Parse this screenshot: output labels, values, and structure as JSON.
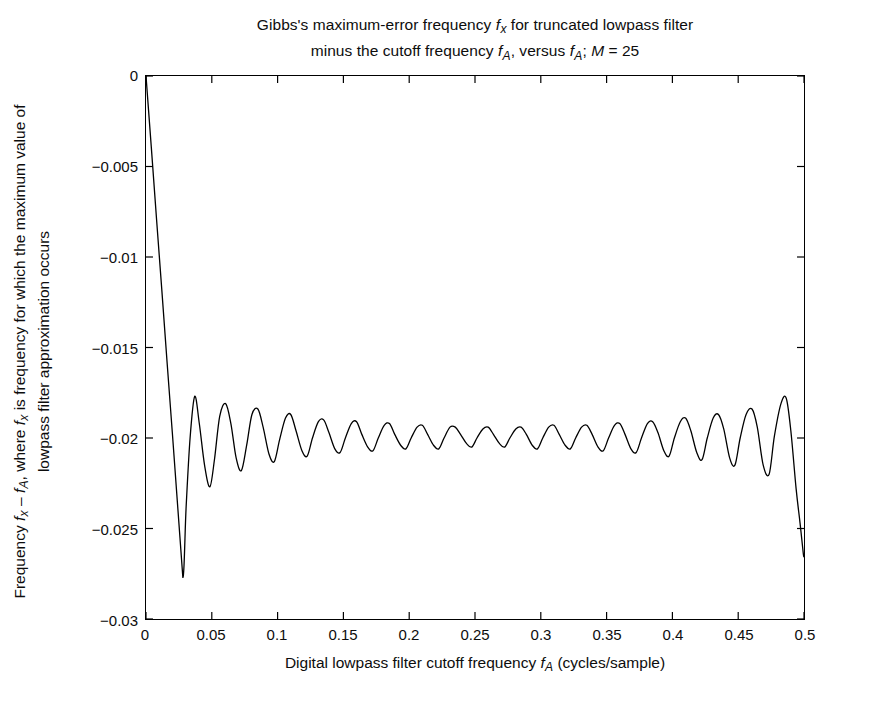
{
  "figure": {
    "background_color": "#ffffff",
    "line_color": "#000000",
    "axis_color": "#000000"
  },
  "title": {
    "line1_pre": "Gibbs's maximum-error frequency ",
    "line1_var": "f",
    "line1_sub": "x",
    "line1_post": " for truncated lowpass filter",
    "line2_pre": "minus the cutoff frequency ",
    "line2_var1": "f",
    "line2_sub1": "A",
    "line2_mid": ", versus ",
    "line2_var2": "f",
    "line2_sub2": "A",
    "line2_post": "; ",
    "line2_m": "M",
    "line2_meq": " = 25",
    "full_text": "Gibbs's maximum-error frequency fx for truncated lowpass filter minus the cutoff frequency fA, versus fA; M = 25"
  },
  "x_axis": {
    "label_pre": "Digital lowpass filter cutoff frequency ",
    "label_var": "f",
    "label_sub": "A",
    "label_post": " (cycles/sample)",
    "label_full": "Digital lowpass filter cutoff frequency fA (cycles/sample)",
    "ticks": [
      "0",
      "0.05",
      "0.1",
      "0.15",
      "0.2",
      "0.25",
      "0.3",
      "0.35",
      "0.4",
      "0.45",
      "0.5"
    ],
    "tick_values": [
      0,
      0.05,
      0.1,
      0.15,
      0.2,
      0.25,
      0.3,
      0.35,
      0.4,
      0.45,
      0.5
    ],
    "min": 0,
    "max": 0.5
  },
  "y_axis": {
    "label_line1_pre": "Frequency ",
    "label_line1_v1": "f",
    "label_line1_s1": "x",
    "label_line1_mid1": " – ",
    "label_line1_v2": "f",
    "label_line1_s2": "A",
    "label_line1_mid2": ", where ",
    "label_line1_v3": "f",
    "label_line1_s3": "x",
    "label_line1_post": " is frequency for which the maximum value of",
    "label_line2": "lowpass filter approximation occurs",
    "label_full": "Frequency fx – fA, where fx is frequency for which the maximum value of lowpass filter approximation occurs",
    "ticks": [
      "0",
      "−0.005",
      "−0.01",
      "−0.015",
      "−0.02",
      "−0.025",
      "−0.03"
    ],
    "tick_values": [
      0,
      -0.005,
      -0.01,
      -0.015,
      -0.02,
      -0.025,
      -0.03
    ],
    "min": -0.03,
    "max": 0
  },
  "chart_data": {
    "type": "line",
    "title": "Gibbs's maximum-error frequency fx for truncated lowpass filter minus the cutoff frequency fA, versus fA; M = 25",
    "xlabel": "Digital lowpass filter cutoff frequency fA (cycles/sample)",
    "ylabel": "Frequency fx – fA, where fx is frequency for which the maximum value of lowpass filter approximation occurs",
    "xlim": [
      0,
      0.5
    ],
    "ylim": [
      -0.03,
      0
    ],
    "grid": false,
    "legend": null,
    "series": [
      {
        "name": "fx - fA",
        "color": "#000000",
        "linewidth": 1.2,
        "x": [
          0.0,
          0.004,
          0.008,
          0.012,
          0.016,
          0.02,
          0.024,
          0.028,
          0.0305,
          0.0335,
          0.037,
          0.0405,
          0.0445,
          0.0485,
          0.052,
          0.056,
          0.0605,
          0.0645,
          0.0685,
          0.0725,
          0.0765,
          0.0805,
          0.085,
          0.089,
          0.0935,
          0.0975,
          0.1015,
          0.106,
          0.11,
          0.114,
          0.1185,
          0.1225,
          0.1265,
          0.131,
          0.135,
          0.139,
          0.1435,
          0.1475,
          0.1515,
          0.156,
          0.16,
          0.164,
          0.1685,
          0.1725,
          0.1765,
          0.181,
          0.185,
          0.189,
          0.1935,
          0.1975,
          0.2015,
          0.206,
          0.21,
          0.214,
          0.2185,
          0.2225,
          0.2265,
          0.231,
          0.235,
          0.239,
          0.2435,
          0.2475,
          0.2515,
          0.256,
          0.26,
          0.264,
          0.2685,
          0.2725,
          0.2765,
          0.281,
          0.285,
          0.289,
          0.2935,
          0.2975,
          0.3015,
          0.306,
          0.31,
          0.314,
          0.3185,
          0.3225,
          0.3265,
          0.331,
          0.335,
          0.339,
          0.3435,
          0.3475,
          0.3515,
          0.356,
          0.36,
          0.364,
          0.3685,
          0.3725,
          0.3765,
          0.381,
          0.385,
          0.389,
          0.3935,
          0.3975,
          0.4015,
          0.406,
          0.41,
          0.414,
          0.4185,
          0.4225,
          0.4265,
          0.431,
          0.435,
          0.439,
          0.4435,
          0.4475,
          0.4515,
          0.456,
          0.4605,
          0.4645,
          0.469,
          0.4735,
          0.4775,
          0.4825,
          0.4865,
          0.49,
          0.494,
          0.497,
          0.4995,
          0.5
        ],
        "y": [
          0.0,
          -0.0039,
          -0.0079,
          -0.0118,
          -0.0158,
          -0.0197,
          -0.0237,
          -0.0277,
          -0.0238,
          -0.02,
          -0.0177,
          -0.0192,
          -0.0215,
          -0.0227,
          -0.0212,
          -0.0188,
          -0.0181,
          -0.0192,
          -0.0211,
          -0.0218,
          -0.0204,
          -0.0187,
          -0.0184,
          -0.0194,
          -0.0209,
          -0.0213,
          -0.0201,
          -0.0189,
          -0.0187,
          -0.0196,
          -0.0207,
          -0.021,
          -0.02,
          -0.0191,
          -0.019,
          -0.0197,
          -0.0206,
          -0.0208,
          -0.02,
          -0.0192,
          -0.0191,
          -0.0198,
          -0.0205,
          -0.0207,
          -0.02,
          -0.0193,
          -0.0192,
          -0.0198,
          -0.0204,
          -0.0206,
          -0.02,
          -0.0194,
          -0.0193,
          -0.0198,
          -0.0204,
          -0.0206,
          -0.02,
          -0.0194,
          -0.0194,
          -0.0198,
          -0.0203,
          -0.0205,
          -0.02,
          -0.0195,
          -0.0194,
          -0.0198,
          -0.0203,
          -0.0205,
          -0.02,
          -0.0195,
          -0.0194,
          -0.0198,
          -0.0204,
          -0.0206,
          -0.02,
          -0.0194,
          -0.0193,
          -0.0198,
          -0.0204,
          -0.0206,
          -0.02,
          -0.0194,
          -0.0193,
          -0.0198,
          -0.0205,
          -0.0207,
          -0.02,
          -0.0193,
          -0.0192,
          -0.0198,
          -0.0206,
          -0.0208,
          -0.02,
          -0.0192,
          -0.0191,
          -0.0197,
          -0.0207,
          -0.021,
          -0.02,
          -0.0191,
          -0.0189,
          -0.0196,
          -0.0208,
          -0.0212,
          -0.02,
          -0.0189,
          -0.0187,
          -0.0195,
          -0.0211,
          -0.0215,
          -0.02,
          -0.0187,
          -0.0184,
          -0.0194,
          -0.0215,
          -0.022,
          -0.0199,
          -0.0181,
          -0.0178,
          -0.0196,
          -0.0228,
          -0.0247,
          -0.0264,
          -0.0265
        ]
      }
    ],
    "annotations": [
      {
        "text": "deep initial minimum",
        "x": 0.028,
        "y": -0.0277
      },
      {
        "text": "oscillation mean level",
        "x": 0.25,
        "y": -0.02
      }
    ]
  }
}
